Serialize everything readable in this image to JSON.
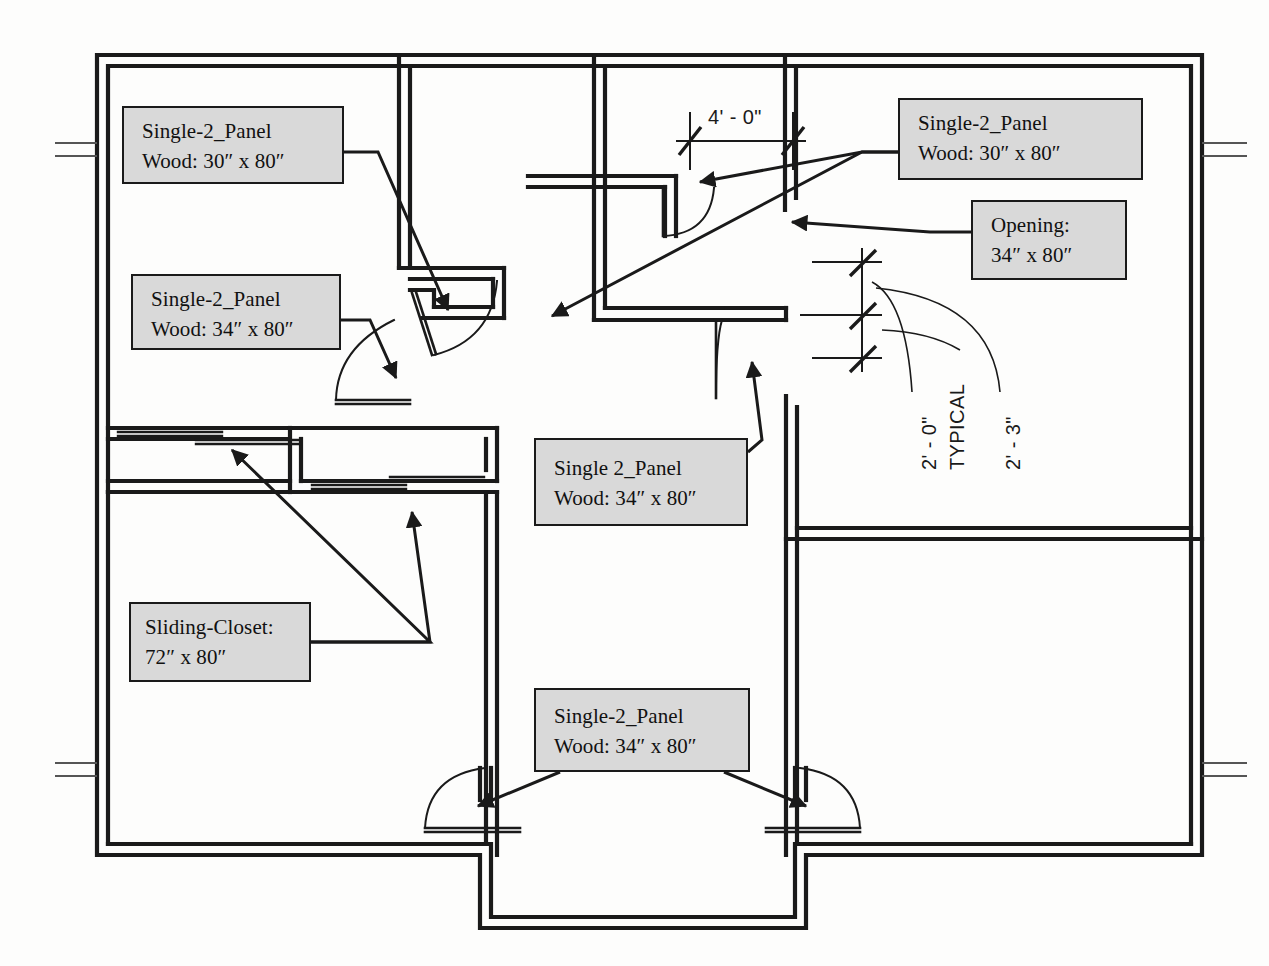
{
  "drawing": {
    "type": "architectural-floor-plan",
    "subject": "Residential apartment floor plan with door and opening schedule callouts",
    "background_color": "#fdfdfc",
    "line_color": "#1a1a1a",
    "callout_fill": "#d9d9d9"
  },
  "callouts": [
    {
      "id": "door-bedroom-upper-left",
      "line1": "Single-2_Panel",
      "line2": "Wood: 30″ x 80″",
      "x": 122,
      "y": 106,
      "w": 222,
      "h": 78
    },
    {
      "id": "door-bedroom-lower-left",
      "line1": "Single-2_Panel",
      "line2": "Wood: 34″ x 80″",
      "x": 131,
      "y": 274,
      "w": 210,
      "h": 76
    },
    {
      "id": "door-bath-upper-right",
      "line1": "Single-2_Panel",
      "line2": "Wood: 30″ x 80″",
      "x": 898,
      "y": 98,
      "w": 245,
      "h": 82
    },
    {
      "id": "opening-right",
      "line1": "Opening:",
      "line2": "34″ x 80″",
      "x": 971,
      "y": 200,
      "w": 156,
      "h": 80
    },
    {
      "id": "door-center",
      "line1": "Single 2_Panel",
      "line2": "Wood: 34″ x 80″",
      "x": 534,
      "y": 438,
      "w": 214,
      "h": 88
    },
    {
      "id": "sliding-closet",
      "line1": "Sliding-Closet:",
      "line2": "72″ x 80″",
      "x": 129,
      "y": 602,
      "w": 182,
      "h": 80
    },
    {
      "id": "door-entry-bottom",
      "line1": "Single-2_Panel",
      "line2": "Wood: 34″ x 80″",
      "x": 534,
      "y": 688,
      "w": 216,
      "h": 84
    }
  ],
  "dimensions": [
    {
      "id": "dim-top-horizontal",
      "text": "4' - 0\"",
      "x": 708,
      "y": 106,
      "rotated": false
    },
    {
      "id": "dim-right-2ft-0in",
      "text": "2' - 0\"",
      "x": 918,
      "y": 470,
      "rotated": true
    },
    {
      "id": "dim-right-typical",
      "text": "TYPICAL",
      "x": 946,
      "y": 470,
      "rotated": true
    },
    {
      "id": "dim-right-2ft-3in",
      "text": "2' - 3\"",
      "x": 1002,
      "y": 470,
      "rotated": true
    }
  ],
  "geometry": {
    "outer_wall": {
      "x": 97,
      "y": 55,
      "w": 1105,
      "h": 800,
      "thickness": 11
    },
    "wall_thickness": 11,
    "room_count": 6,
    "notes": "double-line walls, door swing arcs, sliding closet panels, entry vestibule projection at bottom"
  }
}
